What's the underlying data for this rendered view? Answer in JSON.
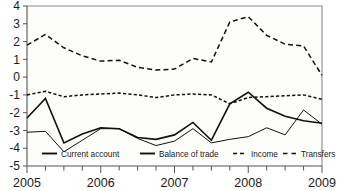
{
  "chart_data": {
    "type": "line",
    "title": "",
    "subtitle": "",
    "xlabel": "",
    "ylabel": "",
    "ylim": [
      -5,
      4
    ],
    "xlim": [
      2005,
      2009
    ],
    "grid": false,
    "legend_position": "bottom-inside",
    "y_ticks": [
      "4",
      "3",
      "2",
      "1",
      "0",
      "-1",
      "-2",
      "-3",
      "-4",
      "-5"
    ],
    "y_tick_values": [
      4,
      3,
      2,
      1,
      0,
      -1,
      -2,
      -3,
      -4,
      -5
    ],
    "x_ticks": [
      "2005",
      "2006",
      "2007",
      "2008",
      "2009"
    ],
    "x_tick_values": [
      2005,
      2006,
      2007,
      2008,
      2009
    ],
    "x_minor_ticks_per_year": 4,
    "x": [
      2005.0,
      2005.25,
      2005.5,
      2005.75,
      2006.0,
      2006.25,
      2006.5,
      2006.75,
      2007.0,
      2007.25,
      2007.5,
      2007.75,
      2008.0,
      2008.25,
      2008.5,
      2008.75,
      2009.0
    ],
    "x_period_labels": [
      "2005Q1",
      "2005Q2",
      "2005Q3",
      "2005Q4",
      "2006Q1",
      "2006Q2",
      "2006Q3",
      "2006Q4",
      "2007Q1",
      "2007Q2",
      "2007Q3",
      "2007Q4",
      "2008Q1",
      "2008Q2",
      "2008Q3",
      "2008Q4",
      "2009Q1"
    ],
    "series": [
      {
        "name": "Current account",
        "style": "solid",
        "color": "#111111",
        "width": 1.6,
        "values": [
          -2.3,
          -1.2,
          -3.7,
          -3.2,
          -2.85,
          -2.9,
          -3.4,
          -3.5,
          -3.25,
          -2.55,
          -3.55,
          -1.5,
          -0.85,
          -1.75,
          -2.2,
          -2.45,
          -2.6
        ]
      },
      {
        "name": "Balance of trade",
        "style": "solid",
        "color": "#111111",
        "width": 1.0,
        "values": [
          -3.1,
          -3.05,
          -4.2,
          -3.55,
          -2.9,
          -2.9,
          -3.45,
          -3.85,
          -3.6,
          -2.9,
          -3.7,
          -3.5,
          -3.35,
          -2.85,
          -3.25,
          -1.85,
          -2.65
        ]
      },
      {
        "name": "Income",
        "style": "dashed-short",
        "color": "#111111",
        "width": 1.5,
        "values": [
          -1.0,
          -0.8,
          -1.1,
          -1.0,
          -0.95,
          -0.9,
          -1.0,
          -1.15,
          -1.0,
          -0.95,
          -1.0,
          -1.5,
          -1.15,
          -1.1,
          -1.05,
          -1.0,
          -1.25
        ]
      },
      {
        "name": "Transfers",
        "style": "dashed-long",
        "color": "#111111",
        "width": 1.5,
        "values": [
          1.8,
          2.4,
          1.65,
          1.2,
          0.9,
          0.95,
          0.55,
          0.4,
          0.45,
          1.05,
          0.85,
          3.1,
          3.4,
          2.35,
          1.85,
          1.75,
          0.1
        ]
      }
    ],
    "annotations": []
  },
  "legend": {
    "items": [
      {
        "label": "Current account",
        "style": "solid"
      },
      {
        "label": "Balance of trade",
        "style": "solid"
      },
      {
        "label": "Income",
        "style": "dashed-short"
      },
      {
        "label": "Transfers",
        "style": "dashed-long"
      }
    ]
  }
}
